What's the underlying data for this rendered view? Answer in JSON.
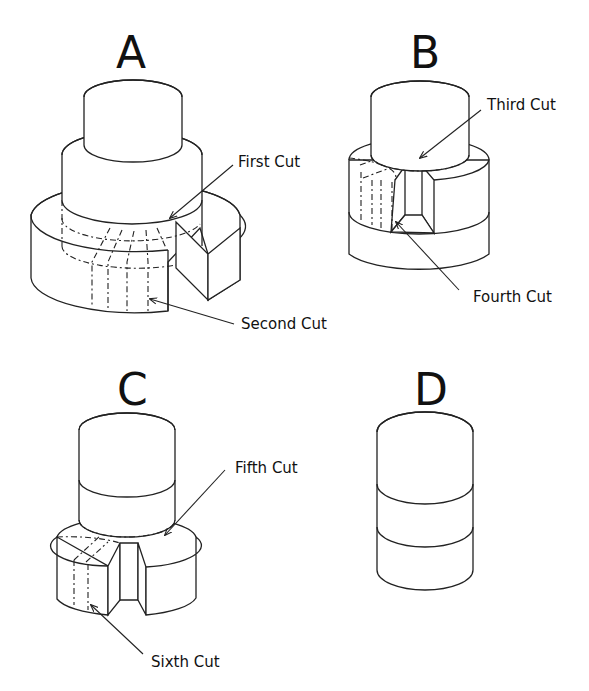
{
  "figure": {
    "panels": [
      {
        "letter": "A",
        "cuts": [
          "First Cut",
          "Second Cut"
        ]
      },
      {
        "letter": "B",
        "cuts": [
          "Third Cut",
          "Fourth Cut"
        ]
      },
      {
        "letter": "C",
        "cuts": [
          "Fifth Cut",
          "Sixth Cut"
        ]
      },
      {
        "letter": "D",
        "cuts": []
      }
    ]
  }
}
